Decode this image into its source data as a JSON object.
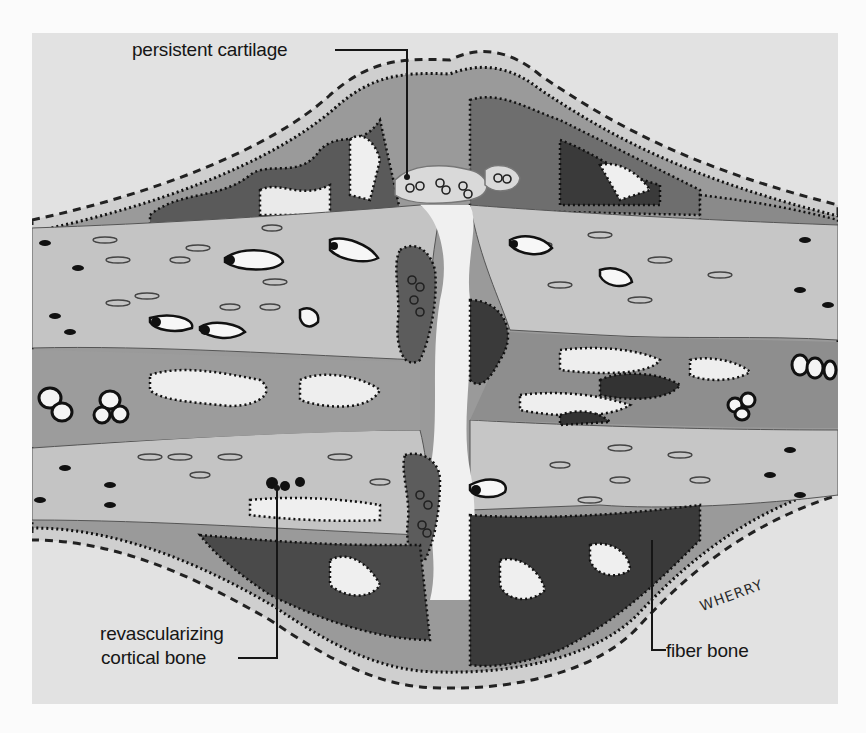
{
  "figure": {
    "labels": {
      "persistent_cartilage": "persistent cartilage",
      "revascularizing_line1": "revascularizing",
      "revascularizing_line2": "cortical bone",
      "fiber_bone": "fiber bone"
    },
    "signature": "WHERRY",
    "colors": {
      "page_background": "#fbfbfb",
      "frame_background": "#e2e2e2",
      "cortical_bone": "#c4c4c4",
      "callus_dark": "#4a4a4a",
      "callus_mid": "#8a8a8a",
      "cartilage": "#d4d4d4",
      "ink": "#161616"
    }
  }
}
